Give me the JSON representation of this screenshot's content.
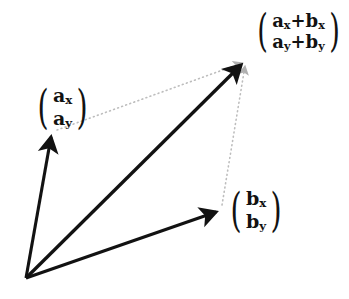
{
  "figure": {
    "background_color": "#ffffff",
    "width": 349,
    "height": 299,
    "stroke_color": "#121212",
    "dotted_color": "#b9b9b9"
  },
  "geometry": {
    "origin": {
      "x": 26,
      "y": 278
    },
    "a_tip": {
      "x": 51,
      "y": 133
    },
    "b_tip": {
      "x": 220,
      "y": 210
    },
    "sum_tip": {
      "x": 245,
      "y": 61
    }
  },
  "labels": {
    "a": {
      "open_paren": "(",
      "close_paren": ")",
      "top_base": "a",
      "top_sub": "x",
      "bottom_base": "a",
      "bottom_sub": "y"
    },
    "b": {
      "open_paren": "(",
      "close_paren": ")",
      "top_base": "b",
      "top_sub": "x",
      "bottom_base": "b",
      "bottom_sub": "y"
    },
    "sum": {
      "open_paren": "(",
      "close_paren": ")",
      "top_first_base": "a",
      "top_first_sub": "x",
      "top_operator": "+",
      "top_second_base": "b",
      "top_second_sub": "x",
      "bottom_first_base": "a",
      "bottom_first_sub": "y",
      "bottom_operator": "+",
      "bottom_second_base": "b",
      "bottom_second_sub": "y"
    }
  }
}
